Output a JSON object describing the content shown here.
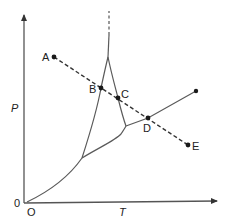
{
  "diagram": {
    "type": "phase-diagram",
    "axes": {
      "y_label": "P",
      "x_label": "T",
      "origin_y_label": "0",
      "origin_x_label": "O"
    },
    "points": [
      {
        "id": "A",
        "label": "A"
      },
      {
        "id": "B",
        "label": "B"
      },
      {
        "id": "C",
        "label": "C"
      },
      {
        "id": "D",
        "label": "D"
      },
      {
        "id": "E",
        "label": "E"
      }
    ],
    "paths": {
      "isobar_path": "A-B-C-D-E (dashed)",
      "critical_extension": "dashed vertical above cusp"
    },
    "colors": {
      "curves": "#5a5a5a",
      "dashed_path": "#333333",
      "points": "#1a1a1a",
      "text": "#222222"
    }
  }
}
